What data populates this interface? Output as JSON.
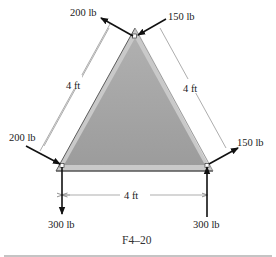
{
  "figure": {
    "caption": "F4–20",
    "colors": {
      "plate_fill": "#a3a3a3",
      "plate_edge_light": "#d8d8d8",
      "plate_edge_dark": "#6a6a6a",
      "arrow": "#111111",
      "dimension_line": "#777777",
      "text": "#1a1a1a"
    },
    "plate": {
      "shape": "equilateral triangle",
      "side_length": "4 ft"
    },
    "dimensions": {
      "left_side": "4 ft",
      "right_side": "4 ft",
      "bottom_side": "4 ft"
    },
    "forces": {
      "top_left": "200 lb",
      "top_right": "150 lb",
      "left_incoming": "200 lb",
      "right_outgoing": "150 lb",
      "bottom_left_down": "300 lb",
      "bottom_right_up": "300 lb"
    }
  }
}
